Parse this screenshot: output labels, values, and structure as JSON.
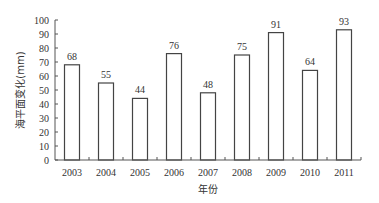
{
  "chart_data": {
    "type": "bar",
    "title": "",
    "xlabel": "年份",
    "ylabel": "海平面变化(mm)",
    "categories": [
      "2003",
      "2004",
      "2005",
      "2006",
      "2007",
      "2008",
      "2009",
      "2010",
      "2011"
    ],
    "values": [
      68,
      55,
      44,
      76,
      48,
      75,
      91,
      64,
      93
    ],
    "ylim": [
      0,
      100
    ],
    "yticks": [
      0,
      10,
      20,
      30,
      40,
      50,
      60,
      70,
      80,
      90,
      100
    ],
    "grid": false,
    "legend": null,
    "bar_fill": "#ffffff",
    "bar_stroke": "#444444",
    "data_labels": true
  }
}
